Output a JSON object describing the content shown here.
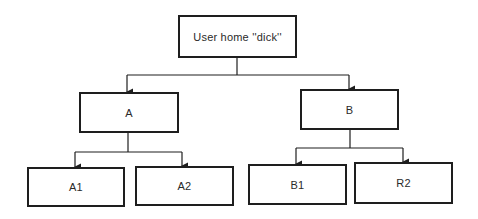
{
  "diagram": {
    "type": "tree",
    "root": {
      "label": "User home ''dick''"
    },
    "level1": [
      {
        "label": "A"
      },
      {
        "label": "B"
      }
    ],
    "level2": [
      {
        "label": "A1",
        "parent": "A"
      },
      {
        "label": "A2",
        "parent": "A"
      },
      {
        "label": "B1",
        "parent": "B"
      },
      {
        "label": "R2",
        "parent": "B"
      }
    ],
    "colors": {
      "line": "#1e1e1e",
      "text": "#2a2a2a",
      "background": "#ffffff"
    }
  }
}
